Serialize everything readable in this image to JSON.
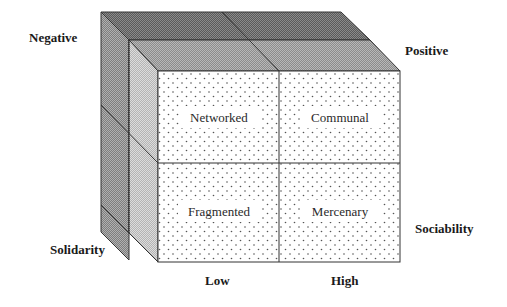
{
  "diagram": {
    "type": "cube-typology",
    "corner_labels": {
      "top_left": "Negative",
      "top_right": "Positive",
      "bottom_left": "Solidarity",
      "bottom_right": "Sociability"
    },
    "bottom_axis": {
      "low": "Low",
      "high": "High"
    },
    "cells": {
      "top_left": "Networked",
      "top_right": "Communal",
      "bottom_left": "Fragmented",
      "bottom_right": "Mercenary"
    },
    "colors": {
      "top_back": "#6e6e6e",
      "top_front": "#a6a6a6",
      "side_back": "#9a9a9a",
      "side_front": "#c8c8c8",
      "front_face": "#ffffff",
      "edge": "#333333"
    }
  }
}
